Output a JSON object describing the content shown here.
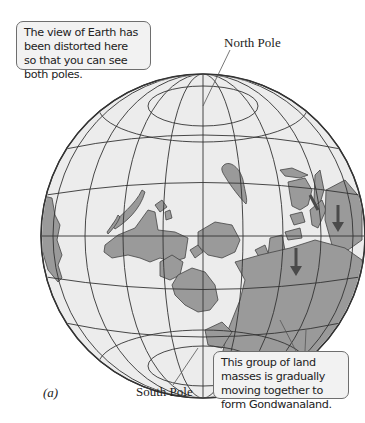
{
  "figure": {
    "panel_label": "(a)",
    "callouts": {
      "top": "The view of Earth has been distorted here so that you can see both poles.",
      "bottom": "This group of land masses is gradually moving together to form Gondwanaland."
    },
    "labels": {
      "north_pole": "North Pole",
      "south_pole": "South Pole"
    },
    "colors": {
      "ocean": "#ececec",
      "land": "#9a9a9a",
      "grid": "#333333",
      "arrow": "#555555"
    }
  }
}
